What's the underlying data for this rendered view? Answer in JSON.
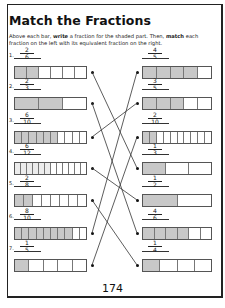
{
  "title": "Match the Fractions",
  "instructions": {
    "part1": "Above each bar, ",
    "bold1": "write",
    "part2": " a fraction for the shaded part. Then, ",
    "bold2": "match",
    "part3": " each fraction on the left with its equivalent fraction on the right."
  },
  "left": [
    {
      "label": "1.",
      "num": "2",
      "den": "6",
      "cells": 6,
      "shaded": 2
    },
    {
      "label": "2.",
      "num": "2",
      "den": "3",
      "cells": 3,
      "shaded": 2
    },
    {
      "label": "3.",
      "num": "6",
      "den": "10",
      "cells": 10,
      "shaded": 6
    },
    {
      "label": "4.",
      "num": "6",
      "den": "12",
      "cells": 12,
      "shaded": 6
    },
    {
      "label": "5.",
      "num": "2",
      "den": "8",
      "cells": 8,
      "shaded": 2
    },
    {
      "label": "6.",
      "num": "8",
      "den": "10",
      "cells": 10,
      "shaded": 8
    },
    {
      "label": "7.",
      "num": "1",
      "den": "5",
      "cells": 5,
      "shaded": 1
    }
  ],
  "right": [
    {
      "num": "4",
      "den": "5",
      "cells": 5,
      "shaded": 4
    },
    {
      "num": "3",
      "den": "5",
      "cells": 5,
      "shaded": 3
    },
    {
      "num": "2",
      "den": "10",
      "cells": 10,
      "shaded": 2
    },
    {
      "num": "1",
      "den": "3",
      "cells": 3,
      "shaded": 1
    },
    {
      "num": "1",
      "den": "2",
      "cells": 2,
      "shaded": 1
    },
    {
      "num": "4",
      "den": "6",
      "cells": 6,
      "shaded": 4
    },
    {
      "num": "1",
      "den": "4",
      "cells": 4,
      "shaded": 1
    }
  ],
  "matches": [
    [
      0,
      3
    ],
    [
      1,
      5
    ],
    [
      2,
      1
    ],
    [
      3,
      4
    ],
    [
      4,
      6
    ],
    [
      5,
      0
    ],
    [
      6,
      2
    ]
  ],
  "page_number": "174",
  "colors": {
    "shaded": "#c8c8c8",
    "line": "#333333"
  }
}
